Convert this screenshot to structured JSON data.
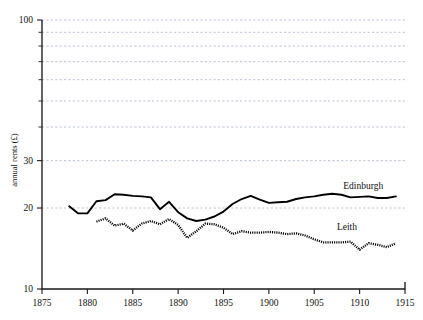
{
  "chart_data": {
    "type": "line",
    "title": "",
    "xlabel": "",
    "ylabel": "annual rents (£)",
    "yscale": "log",
    "ylim": [
      10,
      100
    ],
    "xlim": [
      1875,
      1915
    ],
    "grid": true,
    "legend_position": "inline-right",
    "y_major_ticks": [
      10,
      20,
      30,
      100
    ],
    "y_major_tick_labels": [
      "10",
      "20",
      "30",
      "100"
    ],
    "y_minor_ticks": [
      40,
      50,
      60,
      70,
      80,
      90
    ],
    "x_ticks": [
      1875,
      1880,
      1885,
      1890,
      1895,
      1900,
      1905,
      1910,
      1915
    ],
    "x_tick_labels": [
      "1875",
      "1880",
      "1885",
      "1890",
      "1895",
      "1900",
      "1905",
      "1910",
      "1915"
    ],
    "series": [
      {
        "name": "Edinburgh",
        "style": "solid",
        "color": "#000000",
        "label_x": 1910.4,
        "label_y": 23.6,
        "x": [
          1878,
          1879,
          1880,
          1881,
          1882,
          1883,
          1884,
          1885,
          1886,
          1887,
          1888,
          1889,
          1890,
          1891,
          1892,
          1893,
          1894,
          1895,
          1896,
          1897,
          1898,
          1899,
          1900,
          1901,
          1902,
          1903,
          1904,
          1905,
          1906,
          1907,
          1908,
          1909,
          1910,
          1911,
          1912,
          1913,
          1914
        ],
        "values": [
          20.3,
          19.1,
          19.1,
          21.2,
          21.4,
          22.5,
          22.4,
          22.2,
          22.1,
          21.9,
          19.8,
          21.1,
          19.3,
          18.3,
          17.9,
          18.1,
          18.6,
          19.4,
          20.7,
          21.6,
          22.2,
          21.5,
          20.9,
          21.0,
          21.1,
          21.6,
          21.9,
          22.1,
          22.4,
          22.6,
          22.4,
          21.9,
          22.0,
          22.1,
          21.8,
          21.8,
          22.1
        ]
      },
      {
        "name": "Leith",
        "style": "dotted",
        "color": "#000000",
        "label_x": 1908.6,
        "label_y": 16.6,
        "x": [
          1881,
          1882,
          1883,
          1884,
          1885,
          1886,
          1887,
          1888,
          1889,
          1890,
          1891,
          1892,
          1893,
          1894,
          1895,
          1896,
          1897,
          1898,
          1899,
          1900,
          1901,
          1902,
          1903,
          1904,
          1905,
          1906,
          1907,
          1908,
          1909,
          1910,
          1911,
          1912,
          1913,
          1914
        ],
        "values": [
          17.8,
          18.3,
          17.2,
          17.5,
          16.5,
          17.5,
          17.9,
          17.4,
          18.2,
          17.3,
          15.5,
          16.4,
          17.5,
          17.4,
          16.9,
          16.0,
          16.4,
          16.2,
          16.2,
          16.3,
          16.2,
          16.0,
          16.1,
          15.8,
          15.3,
          14.9,
          14.9,
          14.9,
          15.0,
          14.0,
          14.8,
          14.6,
          14.3,
          14.8
        ]
      }
    ]
  }
}
